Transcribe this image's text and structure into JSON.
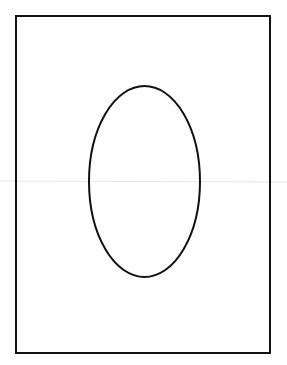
{
  "diagram": {
    "background": "#ffffff",
    "stroke_color": "#111111",
    "crease_color": "#e6e6e6",
    "shapes": [
      {
        "kind": "rectangle",
        "name": "outer-frame",
        "x": 16,
        "y": 16,
        "width": 254,
        "height": 337,
        "stroke_width": 2
      },
      {
        "kind": "ellipse",
        "name": "center-oval",
        "cx": 144.5,
        "cy": 181.5,
        "rx": 55.5,
        "ry": 95.5,
        "stroke_width": 2
      }
    ],
    "crease_line": {
      "y": 181,
      "x1": 0,
      "x2": 287
    }
  }
}
